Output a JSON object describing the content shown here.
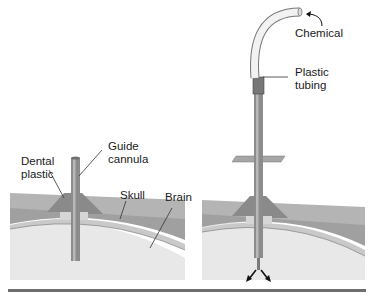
{
  "diagram": {
    "panels": [
      {
        "id": "left",
        "labels": {
          "guide_cannula": "Guide\ncannula",
          "dental_plastic": "Dental\nplastic",
          "skull": "Skull",
          "brain": "Brain"
        }
      },
      {
        "id": "right",
        "labels": {
          "chemical": "Chemical",
          "plastic_tubing": "Plastic\ntubing"
        }
      }
    ],
    "colors": {
      "skull_top": "#a9a9a9",
      "skull_band": "#c4c4c4",
      "dental_plastic": "#8f8f8f",
      "brain": "#e6e6e6",
      "cannula": "#9a9a9a",
      "rule": "#6e6e6e"
    }
  }
}
